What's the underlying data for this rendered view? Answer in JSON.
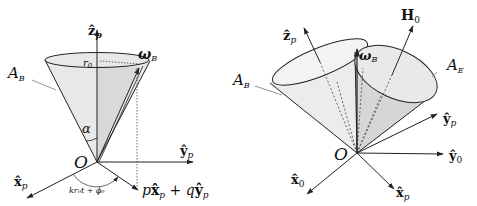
{
  "left_diagram": {
    "axis_z": "ẑ",
    "axis_z_sub": "p",
    "axis_y": "ŷ",
    "axis_y_sub": "p",
    "axis_x": "x̂",
    "axis_x_sub": "p",
    "origin": "O",
    "radius": "r",
    "radius_sub": "0",
    "omega": "ω",
    "omega_sub": "B",
    "cone": "A",
    "cone_sub": "B",
    "angle": "α",
    "phase": "kr₀t + ϕ₀",
    "projection_p": "p",
    "projection_x": "x̂",
    "projection_x_sub": "p",
    "projection_plus": " + ",
    "projection_q": "q",
    "projection_y": "ŷ",
    "projection_y_sub": "p"
  },
  "right_diagram": {
    "axis_z": "ẑ",
    "axis_z_sub": "p",
    "field": "H",
    "field_sub": "0",
    "omega": "ω",
    "omega_sub": "B",
    "cone_b": "A",
    "cone_b_sub": "B",
    "cone_e": "A",
    "cone_e_sub": "E",
    "axis_yp": "ŷ",
    "axis_yp_sub": "p",
    "axis_y0": "ŷ",
    "axis_y0_sub": "0",
    "axis_x0": "x̂",
    "axis_x0_sub": "0",
    "axis_xp": "x̂",
    "axis_xp_sub": "p",
    "origin": "O"
  },
  "colors": {
    "line": "#222222",
    "fill_cone": "#e6e6e6",
    "fill_cone_dark": "#d4d4d4",
    "leader": "#777777"
  }
}
